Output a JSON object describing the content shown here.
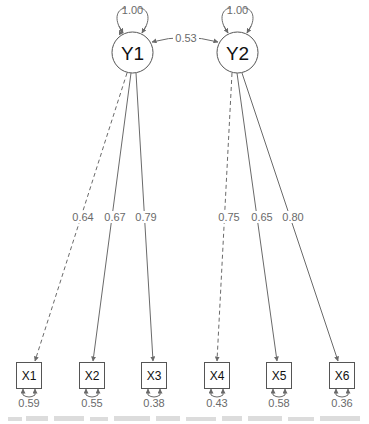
{
  "diagram": {
    "type": "structural-equation-model path diagram",
    "colors": {
      "edge": "#6a6a6a",
      "node_stroke": "#555555",
      "label": "#6a6a6a",
      "node_text": "#111111"
    },
    "latent_variables": [
      {
        "id": "Y1",
        "label": "Y1",
        "variance": "1.00"
      },
      {
        "id": "Y2",
        "label": "Y2",
        "variance": "1.00"
      }
    ],
    "covariance": {
      "from": "Y1",
      "to": "Y2",
      "value": "0.53"
    },
    "observed_variables": [
      {
        "id": "X1",
        "label": "X1",
        "residual": "0.59"
      },
      {
        "id": "X2",
        "label": "X2",
        "residual": "0.55"
      },
      {
        "id": "X3",
        "label": "X3",
        "residual": "0.38"
      },
      {
        "id": "X4",
        "label": "X4",
        "residual": "0.43"
      },
      {
        "id": "X5",
        "label": "X5",
        "residual": "0.58"
      },
      {
        "id": "X6",
        "label": "X6",
        "residual": "0.36"
      }
    ],
    "loadings": [
      {
        "from": "Y1",
        "to": "X1",
        "value": "0.64",
        "style": "dashed"
      },
      {
        "from": "Y1",
        "to": "X2",
        "value": "0.67",
        "style": "solid"
      },
      {
        "from": "Y1",
        "to": "X3",
        "value": "0.79",
        "style": "solid"
      },
      {
        "from": "Y2",
        "to": "X4",
        "value": "0.75",
        "style": "dashed"
      },
      {
        "from": "Y2",
        "to": "X5",
        "value": "0.65",
        "style": "solid"
      },
      {
        "from": "Y2",
        "to": "X6",
        "value": "0.80",
        "style": "solid"
      }
    ]
  },
  "caption": {
    "text": "",
    "note": "faded, cut-off caption line at bottom edge (illegible)"
  }
}
